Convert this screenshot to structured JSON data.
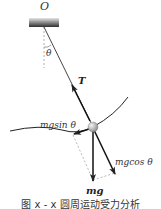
{
  "diagram": {
    "type": "physics-force-diagram",
    "labels": {
      "pivot": "O",
      "angle": "θ",
      "tension": "T",
      "tangential": "mgsin θ",
      "normal": "mgcos θ",
      "gravity": "mg"
    },
    "caption": "图 x - x  圆周运动受力分析",
    "colors": {
      "line": "#333333",
      "dashed": "#999999",
      "ceiling_top": "#cccccc",
      "ceiling_bottom": "#333333",
      "ball": "#b8b8b8"
    }
  }
}
